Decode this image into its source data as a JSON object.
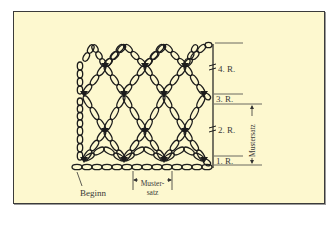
{
  "colors": {
    "background": "#fdf8cf",
    "ink": "#1c1c1c",
    "frame": "#3b3b3b"
  },
  "labels": {
    "row1": "1. R.",
    "row2": "2. R.",
    "row3": "3. R.",
    "row4": "4. R.",
    "start": "Beginn",
    "repeat_h_line1": "Muster-",
    "repeat_h_line2": "satz",
    "repeat_v": "Mustersatz"
  }
}
